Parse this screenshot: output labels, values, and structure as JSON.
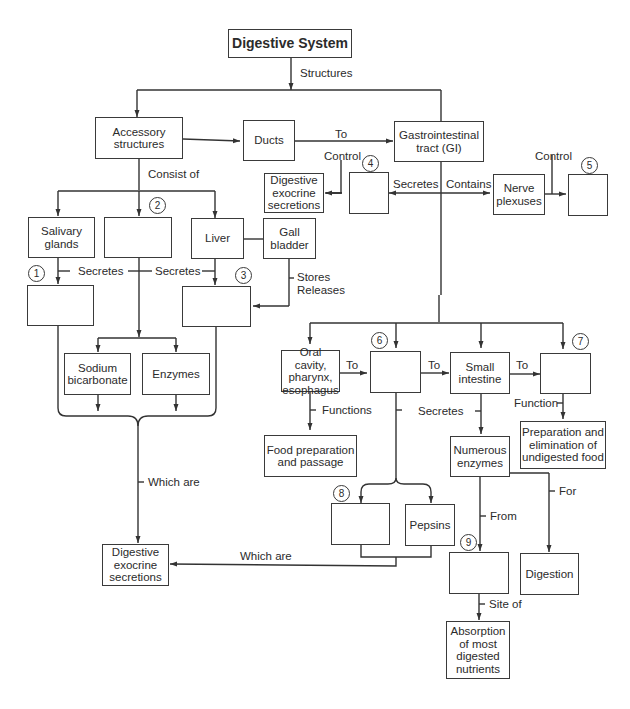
{
  "diagram": {
    "title": "Digestive System",
    "nodes": {
      "root": "Digestive System",
      "accessory": "Accessory\nstructures",
      "ducts": "Ducts",
      "gi": "Gastrointestinal\ntract (GI)",
      "dig_exo_top": "Digestive\nexocrine\nsecretions",
      "box4": "",
      "nerve": "Nerve\nplexuses",
      "box5": "",
      "salivary": "Salivary\nglands",
      "box2": "",
      "liver": "Liver",
      "gall": "Gall\nbladder",
      "box1": "",
      "box3": "",
      "sodium": "Sodium\nbicarbonate",
      "enzymes": "Enzymes",
      "dig_exo_bottom": "Digestive\nexocrine\nsecretions",
      "oral": "Oral cavity,\npharynx,\nesophagus",
      "box6": "",
      "small": "Small\nintestine",
      "box7": "",
      "food_prep": "Food preparation\nand passage",
      "numerous": "Numerous\nenzymes",
      "prep_elim": "Preparation and\nelimination of\nundigested food",
      "box8": "",
      "pepsins": "Pepsins",
      "box9": "",
      "digestion": "Digestion",
      "absorption": "Absorption\nof most\ndigested\nnutrients"
    },
    "edge_labels": {
      "structures": "Structures",
      "consist_of": "Consist of",
      "to_gi": "To",
      "control4": "Control",
      "secretes_gi": "Secretes",
      "contains": "Contains",
      "control5": "Control",
      "secretes1": "Secretes",
      "secretes2": "Secretes",
      "stores_releases": "Stores\nReleases",
      "which_are_1": "Which are",
      "which_are_2": "Which are",
      "to_6": "To",
      "to_small": "To",
      "to_7": "To",
      "functions": "Functions",
      "secretes_small": "Secretes",
      "function": "Function",
      "from": "From",
      "for": "For",
      "site_of": "Site of"
    },
    "numbers": [
      "1",
      "2",
      "3",
      "4",
      "5",
      "6",
      "7",
      "8",
      "9"
    ]
  }
}
